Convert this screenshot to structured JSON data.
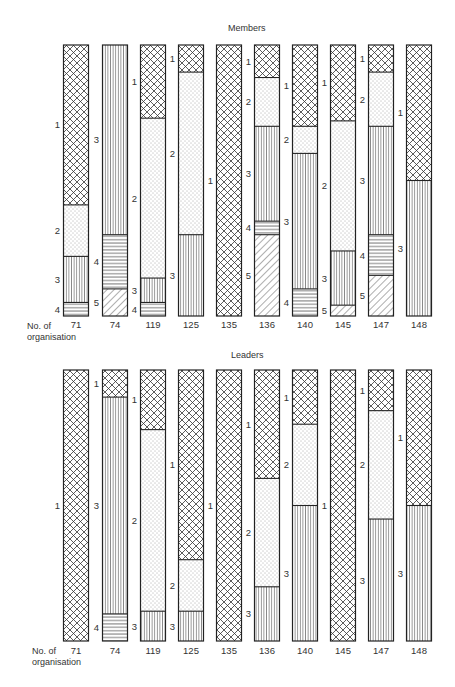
{
  "chart_data": [
    {
      "type": "bar",
      "subtype": "stacked-100-percent",
      "title": "Members",
      "xlabel": "No. of organisation",
      "ylabel": "",
      "grid": false,
      "legend": "segment numbers labelled beside each bar (1-5)",
      "categories": [
        "71",
        "74",
        "119",
        "125",
        "135",
        "136",
        "140",
        "145",
        "147",
        "148"
      ],
      "pattern_key": {
        "1": "cross-hatch",
        "2": "dotted",
        "3": "vertical lines",
        "4": "horizontal lines",
        "5": "diagonal lines"
      },
      "bars": [
        {
          "category": "71",
          "segments": [
            {
              "id": "1",
              "from": 0.0,
              "to": 0.59
            },
            {
              "id": "2",
              "from": 0.59,
              "to": 0.78
            },
            {
              "id": "3",
              "from": 0.78,
              "to": 0.95
            },
            {
              "id": "4",
              "from": 0.95,
              "to": 1.0
            }
          ]
        },
        {
          "category": "74",
          "segments": [
            {
              "id": "3",
              "from": 0.0,
              "to": 0.7
            },
            {
              "id": "4",
              "from": 0.7,
              "to": 0.9
            },
            {
              "id": "5",
              "from": 0.9,
              "to": 1.0
            }
          ]
        },
        {
          "category": "119",
          "segments": [
            {
              "id": "1",
              "from": 0.0,
              "to": 0.27
            },
            {
              "id": "2",
              "from": 0.27,
              "to": 0.86
            },
            {
              "id": "3",
              "from": 0.86,
              "to": 0.95
            },
            {
              "id": "4",
              "from": 0.95,
              "to": 1.0
            }
          ]
        },
        {
          "category": "125",
          "segments": [
            {
              "id": "1",
              "from": 0.0,
              "to": 0.1
            },
            {
              "id": "2",
              "from": 0.1,
              "to": 0.7
            },
            {
              "id": "3",
              "from": 0.7,
              "to": 1.0
            }
          ]
        },
        {
          "category": "135",
          "segments": [
            {
              "id": "1",
              "from": 0.0,
              "to": 1.0
            }
          ]
        },
        {
          "category": "136",
          "segments": [
            {
              "id": "1",
              "from": 0.0,
              "to": 0.12
            },
            {
              "id": "2",
              "from": 0.12,
              "to": 0.3
            },
            {
              "id": "3",
              "from": 0.3,
              "to": 0.65
            },
            {
              "id": "4",
              "from": 0.65,
              "to": 0.7
            },
            {
              "id": "5",
              "from": 0.7,
              "to": 1.0
            }
          ]
        },
        {
          "category": "140",
          "segments": [
            {
              "id": "1",
              "from": 0.0,
              "to": 0.3
            },
            {
              "id": "2",
              "from": 0.3,
              "to": 0.4
            },
            {
              "id": "3",
              "from": 0.4,
              "to": 0.9
            },
            {
              "id": "4",
              "from": 0.9,
              "to": 1.0
            }
          ]
        },
        {
          "category": "145",
          "segments": [
            {
              "id": "1",
              "from": 0.0,
              "to": 0.28
            },
            {
              "id": "2",
              "from": 0.28,
              "to": 0.76
            },
            {
              "id": "3",
              "from": 0.76,
              "to": 0.96
            },
            {
              "id": "5",
              "from": 0.96,
              "to": 1.0
            }
          ]
        },
        {
          "category": "147",
          "segments": [
            {
              "id": "1",
              "from": 0.0,
              "to": 0.1
            },
            {
              "id": "2",
              "from": 0.1,
              "to": 0.3
            },
            {
              "id": "3",
              "from": 0.3,
              "to": 0.7
            },
            {
              "id": "4",
              "from": 0.7,
              "to": 0.85
            },
            {
              "id": "5",
              "from": 0.85,
              "to": 1.0
            }
          ]
        },
        {
          "category": "148",
          "segments": [
            {
              "id": "1",
              "from": 0.0,
              "to": 0.5
            },
            {
              "id": "3",
              "from": 0.5,
              "to": 1.0
            }
          ]
        }
      ]
    },
    {
      "type": "bar",
      "subtype": "stacked-100-percent",
      "title": "Leaders",
      "xlabel": "No. of organisation",
      "ylabel": "",
      "grid": false,
      "legend": "segment numbers labelled beside each bar (1-4)",
      "categories": [
        "71",
        "74",
        "119",
        "125",
        "135",
        "136",
        "140",
        "145",
        "147",
        "148"
      ],
      "pattern_key": {
        "1": "cross-hatch",
        "2": "dotted",
        "3": "vertical lines",
        "4": "horizontal lines"
      },
      "bars": [
        {
          "category": "71",
          "segments": [
            {
              "id": "1",
              "from": 0.0,
              "to": 1.0
            }
          ]
        },
        {
          "category": "74",
          "segments": [
            {
              "id": "1",
              "from": 0.0,
              "to": 0.1
            },
            {
              "id": "3",
              "from": 0.1,
              "to": 0.9
            },
            {
              "id": "4",
              "from": 0.9,
              "to": 1.0
            }
          ]
        },
        {
          "category": "119",
          "segments": [
            {
              "id": "1",
              "from": 0.0,
              "to": 0.22
            },
            {
              "id": "2",
              "from": 0.22,
              "to": 0.89
            },
            {
              "id": "3",
              "from": 0.89,
              "to": 1.0
            }
          ]
        },
        {
          "category": "125",
          "segments": [
            {
              "id": "1",
              "from": 0.0,
              "to": 0.7
            },
            {
              "id": "2",
              "from": 0.7,
              "to": 0.89
            },
            {
              "id": "3",
              "from": 0.89,
              "to": 1.0
            }
          ]
        },
        {
          "category": "135",
          "segments": [
            {
              "id": "1",
              "from": 0.0,
              "to": 1.0
            }
          ]
        },
        {
          "category": "136",
          "segments": [
            {
              "id": "1",
              "from": 0.0,
              "to": 0.4
            },
            {
              "id": "2",
              "from": 0.4,
              "to": 0.8
            },
            {
              "id": "3",
              "from": 0.8,
              "to": 1.0
            }
          ]
        },
        {
          "category": "140",
          "segments": [
            {
              "id": "1",
              "from": 0.0,
              "to": 0.2
            },
            {
              "id": "2",
              "from": 0.2,
              "to": 0.5
            },
            {
              "id": "3",
              "from": 0.5,
              "to": 1.0
            }
          ]
        },
        {
          "category": "145",
          "segments": [
            {
              "id": "1",
              "from": 0.0,
              "to": 1.0
            }
          ]
        },
        {
          "category": "147",
          "segments": [
            {
              "id": "1",
              "from": 0.0,
              "to": 0.15
            },
            {
              "id": "2",
              "from": 0.15,
              "to": 0.55
            },
            {
              "id": "3",
              "from": 0.55,
              "to": 1.0
            }
          ]
        },
        {
          "category": "148",
          "segments": [
            {
              "id": "1",
              "from": 0.0,
              "to": 0.5
            },
            {
              "id": "3",
              "from": 0.5,
              "to": 1.0
            }
          ]
        }
      ]
    }
  ],
  "labels": {
    "members_title": "Members",
    "leaders_title": "Leaders",
    "xlabel_line1": "No. of",
    "xlabel_line2": "organisation"
  },
  "colors": {
    "ink": "#222222",
    "background": "#ffffff"
  }
}
